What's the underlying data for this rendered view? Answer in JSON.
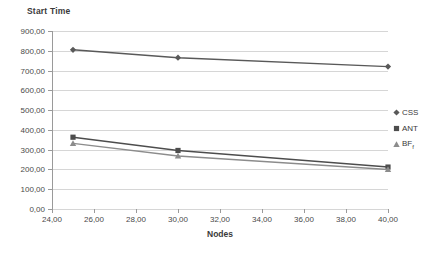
{
  "chart_data": {
    "type": "line",
    "title": "Start Time",
    "xlabel": "Nodes",
    "ylabel": "",
    "x": [
      25,
      30,
      40
    ],
    "xlim": [
      24,
      40
    ],
    "ylim": [
      0,
      900
    ],
    "grid": true,
    "legend_position": "right",
    "x_tick_labels": [
      "24,00",
      "26,00",
      "28,00",
      "30,00",
      "32,00",
      "34,00",
      "36,00",
      "38,00",
      "40,00"
    ],
    "x_tick_values": [
      24,
      26,
      28,
      30,
      32,
      34,
      36,
      38,
      40
    ],
    "y_tick_labels": [
      "0,00",
      "100,00",
      "200,00",
      "300,00",
      "400,00",
      "500,00",
      "600,00",
      "700,00",
      "800,00",
      "900,00"
    ],
    "y_tick_values": [
      0,
      100,
      200,
      300,
      400,
      500,
      600,
      700,
      800,
      900
    ],
    "series": [
      {
        "name": "CSS",
        "marker": "diamond",
        "color": "#595959",
        "values": [
          805,
          765,
          720
        ]
      },
      {
        "name": "ANT",
        "marker": "square",
        "color": "#4d4d4d",
        "values": [
          363,
          296,
          212
        ]
      },
      {
        "name": "BF_f",
        "label_main": "BF",
        "label_sub": "f",
        "marker": "triangle",
        "color": "#8c8c8c",
        "values": [
          332,
          268,
          200
        ]
      }
    ]
  },
  "legend": {
    "entries": [
      {
        "label": "CSS"
      },
      {
        "label": "ANT"
      },
      {
        "label": "BF"
      }
    ]
  },
  "colors": {
    "gridline": "#d6d6d6",
    "axis": "#9a9a9a",
    "text": "#3a3a3a",
    "background": "#ffffff"
  }
}
